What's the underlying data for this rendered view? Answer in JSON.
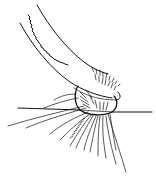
{
  "figure": {
    "type": "line-art illustration",
    "colors": {
      "ink": "#111111",
      "background": "#ffffff"
    },
    "labels": []
  }
}
